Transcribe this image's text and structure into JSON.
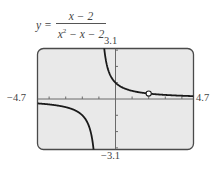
{
  "equation": {
    "lhs": "y =",
    "numerator": "x − 2",
    "denominator_base": "x",
    "denominator_exp": "2",
    "denominator_rest": " − x − 2"
  },
  "labels": {
    "ymax": "3.1",
    "ymin": "−3.1",
    "xmin": "−4.7",
    "xmax": "4.7"
  },
  "colors": {
    "frame_bg": "#e9e9e9",
    "frame_border": "#4a4a4a",
    "curve": "#1a1a1a",
    "axis": "#6a6a6a"
  },
  "chart_data": {
    "type": "line",
    "xlabel": "",
    "ylabel": "",
    "xlim": [
      -4.7,
      4.7
    ],
    "ylim": [
      -3.1,
      3.1
    ],
    "x_tick_step": 1,
    "y_tick_step": 1,
    "grid": false,
    "vertical_asymptote": -1,
    "horizontal_asymptote": 0,
    "hole": {
      "x": 2,
      "y": 0.3333
    },
    "series": [
      {
        "name": "left branch",
        "x": [
          -4.7,
          -4.0,
          -3.5,
          -3.0,
          -2.5,
          -2.0,
          -1.75,
          -1.5,
          -1.4,
          -1.32
        ],
        "y": [
          -0.27,
          -0.33,
          -0.4,
          -0.5,
          -0.67,
          -1.0,
          -1.33,
          -2.0,
          -2.5,
          -3.1
        ]
      },
      {
        "name": "right branch",
        "x": [
          -0.68,
          -0.6,
          -0.5,
          -0.25,
          0,
          0.5,
          1,
          1.5,
          2,
          2.5,
          3,
          3.5,
          4,
          4.7
        ],
        "y": [
          3.1,
          2.5,
          2.0,
          1.33,
          1.0,
          0.67,
          0.5,
          0.4,
          0.333,
          0.286,
          0.25,
          0.222,
          0.2,
          0.175
        ]
      }
    ]
  }
}
